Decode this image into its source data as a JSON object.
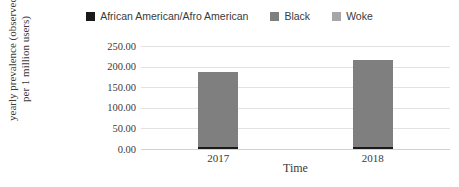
{
  "legend": {
    "position": "top",
    "entries": [
      {
        "label": "African American/Afro American",
        "color": "#1a1a1a",
        "icon": "legend-swatch-icon"
      },
      {
        "label": "Black",
        "color": "#7f7f7f",
        "icon": "legend-swatch-icon"
      },
      {
        "label": "Woke",
        "color": "#a6a6a6",
        "icon": "legend-swatch-icon"
      }
    ]
  },
  "axes": {
    "y_title": "yearly prevalence (observed per 1 million users)",
    "x_title": "Time",
    "y_ticks": [
      "0.00",
      "50.00",
      "100.00",
      "150.00",
      "200.00",
      "250.00"
    ],
    "x_ticks": [
      "2017",
      "2018"
    ]
  },
  "chart_data": {
    "type": "bar",
    "title": "",
    "subtitle": "",
    "xlabel": "Time",
    "ylabel": "yearly prevalence (observed per 1 million users)",
    "categories": [
      "2017",
      "2018"
    ],
    "series": [
      {
        "name": "African American/Afro American",
        "color": "#1a1a1a",
        "values": [
          5,
          5
        ]
      },
      {
        "name": "Black",
        "color": "#7f7f7f",
        "values": [
          182,
          212
        ]
      },
      {
        "name": "Woke",
        "color": "#a6a6a6",
        "values": [
          0,
          0
        ]
      }
    ],
    "ylim": [
      0,
      250
    ],
    "ytick_step": 50,
    "grid": true,
    "grid_axis": "y",
    "legend_position": "top",
    "stacked": true
  }
}
